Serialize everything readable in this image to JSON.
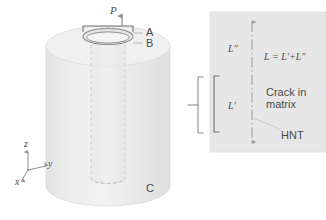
{
  "figure": {
    "colors": {
      "cylinder_fill": "#e9e9e9",
      "cylinder_top_fill": "#efefef",
      "inset_fill": "#e6e6e6",
      "line": "#9a9a9a",
      "text": "#4a4a4a",
      "background": "#ffffff"
    }
  },
  "left_panel": {
    "load_label": "P",
    "point_a": "A",
    "point_b": "B",
    "point_c": "C",
    "axes": {
      "z": "z",
      "y": "y",
      "x": "x"
    }
  },
  "inset_panel": {
    "upper_length": "L″",
    "lower_length": "L′",
    "equation": "L = L′+L″",
    "crack_line1": "Crack in",
    "crack_line2": "matrix",
    "nanotube_label": "HNT"
  }
}
